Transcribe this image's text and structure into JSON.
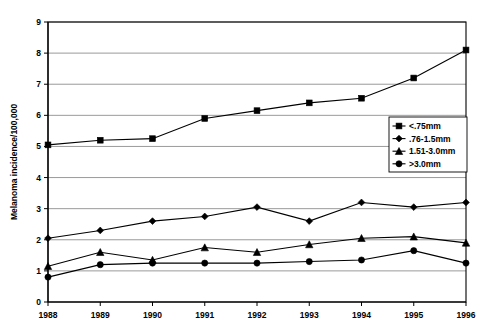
{
  "chart_data": {
    "type": "line",
    "title": "",
    "xlabel": "",
    "ylabel": "Melanoma incidence/100,000",
    "categories": [
      "1988",
      "1989",
      "1990",
      "1991",
      "1992",
      "1993",
      "1994",
      "1995",
      "1996"
    ],
    "x": [
      1988,
      1989,
      1990,
      1991,
      1992,
      1993,
      1994,
      1995,
      1996
    ],
    "ylim": [
      0,
      9
    ],
    "yticks": [
      "0",
      "1",
      "2",
      "3",
      "4",
      "5",
      "6",
      "7",
      "8",
      "9"
    ],
    "ytick_values": [
      0,
      1,
      2,
      3,
      4,
      5,
      6,
      7,
      8,
      9
    ],
    "grid": "horizontal",
    "legend_position": "right-middle",
    "series": [
      {
        "name": "<.75mm",
        "marker": "square",
        "values": [
          5.05,
          5.2,
          5.25,
          5.9,
          6.15,
          6.4,
          6.55,
          7.2,
          8.1
        ]
      },
      {
        "name": ".76-1.5mm",
        "marker": "diamond",
        "values": [
          2.05,
          2.3,
          2.6,
          2.75,
          3.05,
          2.6,
          3.2,
          3.05,
          3.2
        ]
      },
      {
        "name": "1.51-3.0mm",
        "marker": "triangle",
        "values": [
          1.15,
          1.6,
          1.35,
          1.75,
          1.6,
          1.85,
          2.05,
          2.1,
          1.9
        ]
      },
      {
        "name": ">3.0mm",
        "marker": "circle",
        "values": [
          0.8,
          1.2,
          1.25,
          1.25,
          1.25,
          1.3,
          1.35,
          1.65,
          1.25
        ]
      }
    ],
    "colors": {
      "series_line": "#000000",
      "marker": "#000000",
      "gridline": "#808080",
      "axis": "#000000",
      "background": "#ffffff"
    }
  }
}
